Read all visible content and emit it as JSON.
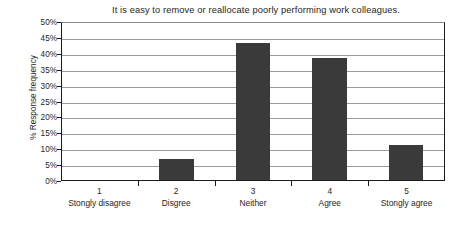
{
  "chart_data": {
    "type": "bar",
    "title": "It is easy to remove or reallocate poorly performing work colleagues.",
    "xlabel": "",
    "ylabel": "% Response frequency",
    "categories": [
      "Stongly disagree",
      "Disgree",
      "Neither",
      "Agree",
      "Stongly agree"
    ],
    "category_numbers": [
      "1",
      "2",
      "3",
      "4",
      "5"
    ],
    "values": [
      0,
      6.5,
      43,
      38.3,
      11
    ],
    "ylim": [
      0,
      50
    ],
    "ytick_labels": [
      "0%",
      "5%",
      "10%",
      "15%",
      "20%",
      "25%",
      "30%",
      "35%",
      "40%",
      "45%",
      "50%"
    ],
    "ytick_values": [
      0,
      5,
      10,
      15,
      20,
      25,
      30,
      35,
      40,
      45,
      50
    ],
    "grid": true,
    "legend": false,
    "series": [
      {
        "name": "% Response frequency",
        "values": [
          0,
          6.5,
          43,
          38.3,
          11
        ],
        "color": "#3a3a3a"
      }
    ],
    "colors": {
      "bar": "#3a3a3a",
      "gridline": "#9b9b9b",
      "axis": "#1a1a1a",
      "text": "#262626",
      "background": "#ffffff"
    }
  }
}
